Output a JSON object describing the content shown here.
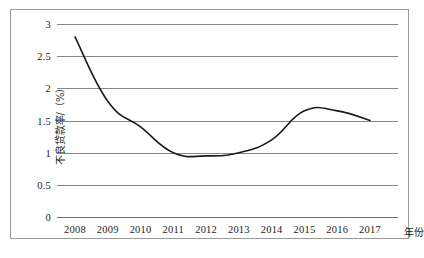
{
  "chart_data": {
    "type": "line",
    "title": "",
    "xlabel": "年份",
    "ylabel": "不良贷款率/（%）",
    "categories": [
      "2008",
      "2009",
      "2010",
      "2011",
      "2012",
      "2013",
      "2014",
      "2015",
      "2016",
      "2017"
    ],
    "series": [
      {
        "name": "不良贷款率",
        "values": [
          2.8,
          1.8,
          1.4,
          1.0,
          0.95,
          1.0,
          1.2,
          1.65,
          1.65,
          1.5
        ]
      }
    ],
    "ylim": [
      0,
      3
    ],
    "ytick_labels": [
      "0",
      "0.5",
      "1",
      "1.5",
      "2",
      "2.5",
      "3"
    ],
    "ytick_values": [
      0,
      0.5,
      1,
      1.5,
      2,
      2.5,
      3
    ],
    "grid": true,
    "legend": false,
    "legend_position": "none",
    "line_color": "#1a1a1a",
    "grid_color": "#868686",
    "frame_color": "#9a9a9a"
  }
}
